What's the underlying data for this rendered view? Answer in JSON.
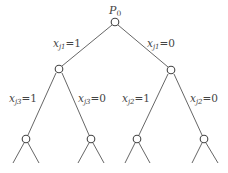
{
  "diagram": {
    "type": "binary-branching-tree",
    "root": {
      "label_main": "P",
      "label_sub": "0",
      "x": 115,
      "y": 22
    },
    "level1": {
      "variable_main": "x",
      "variable_sub": "j1",
      "left": {
        "x": 59,
        "y": 69,
        "edge_label_value": "=1"
      },
      "right": {
        "x": 171,
        "y": 70,
        "edge_label_value": "=0"
      }
    },
    "level2_left": {
      "variable_main": "x",
      "variable_sub": "j3",
      "left": {
        "x": 26,
        "y": 139,
        "edge_label_value": "=1"
      },
      "right": {
        "x": 91,
        "y": 139,
        "edge_label_value": "=0"
      }
    },
    "level2_right": {
      "variable_main": "x",
      "variable_sub": "j2",
      "left": {
        "x": 137,
        "y": 139,
        "edge_label_value": "=1"
      },
      "right": {
        "x": 204,
        "y": 139,
        "edge_label_value": "=0"
      }
    },
    "colors": {
      "line": "#555555",
      "node_stroke": "#444444",
      "text": "#444444",
      "background": "#ffffff"
    }
  }
}
